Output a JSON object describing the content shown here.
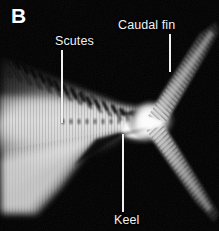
{
  "figure": {
    "panel_letter": "B",
    "background_color": "#000000",
    "label_color": "#f2f2f2",
    "width": 219,
    "height": 231,
    "image_type": "radiograph"
  },
  "annotations": [
    {
      "id": "scutes",
      "label": "Scutes",
      "leader": "vertical-line-down"
    },
    {
      "id": "caudal-fin",
      "label": "Caudal fin",
      "leader": "vertical-line-down"
    },
    {
      "id": "keel",
      "label": "Keel",
      "leader": "vertical-line-up"
    }
  ]
}
